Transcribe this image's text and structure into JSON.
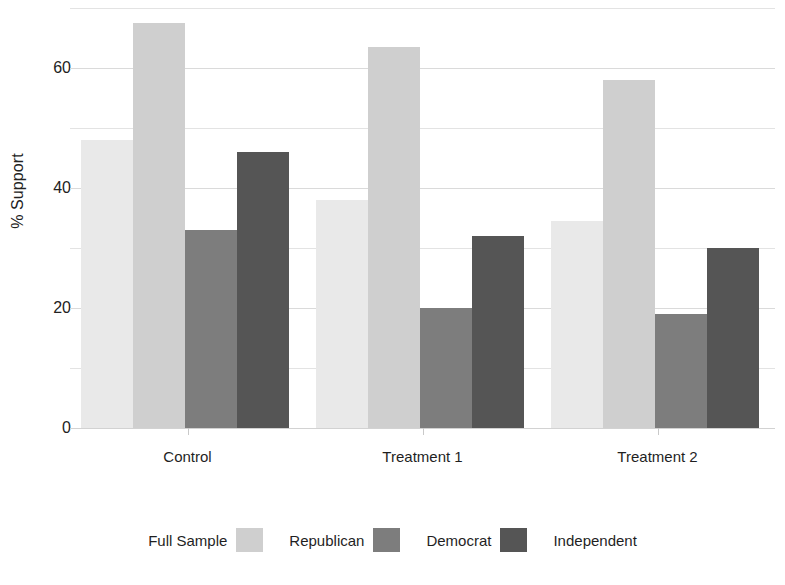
{
  "chart_data": {
    "type": "bar",
    "title": "",
    "xlabel": "",
    "ylabel": "% Support",
    "ylim": [
      0,
      70
    ],
    "yticks": [
      0,
      20,
      40,
      60
    ],
    "ytick_labels": [
      "0",
      "20",
      "40",
      "60"
    ],
    "minor_gridlines": [
      10,
      30,
      50,
      70
    ],
    "grid": true,
    "legend_position": "bottom",
    "categories": [
      "Control",
      "Treatment 1",
      "Treatment 2"
    ],
    "series": [
      {
        "name": "Full Sample",
        "color": "#e9e9e9",
        "values": [
          48.0,
          38.0,
          34.5
        ]
      },
      {
        "name": "Republican",
        "color": "#cfcfcf",
        "values": [
          67.5,
          63.5,
          58.0
        ]
      },
      {
        "name": "Democrat",
        "color": "#7d7d7d",
        "values": [
          33.0,
          20.0,
          19.0
        ]
      },
      {
        "name": "Independent",
        "color": "#555555",
        "values": [
          46.0,
          32.0,
          30.0
        ]
      }
    ]
  },
  "axis": {
    "y_title": "% Support",
    "y_tick_0": "0",
    "y_tick_20": "20",
    "y_tick_40": "40",
    "y_tick_60": "60"
  },
  "x_axis": {
    "labels": [
      "Control",
      "Treatment 1",
      "Treatment 2"
    ]
  },
  "legend": {
    "entries": [
      {
        "label": "Full Sample",
        "color": "#e9e9e9"
      },
      {
        "label": "Republican",
        "color": "#cfcfcf"
      },
      {
        "label": "Democrat",
        "color": "#7d7d7d"
      },
      {
        "label": "Independent",
        "color": "#555555"
      }
    ]
  },
  "colors": {
    "background": "#ffffff",
    "gridline": "#e3e3e3",
    "text": "#1f1f1f"
  }
}
